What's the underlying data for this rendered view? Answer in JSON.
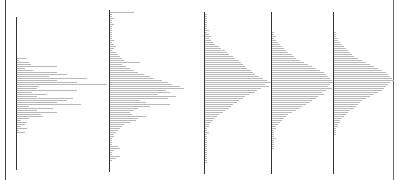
{
  "document": {
    "description": "Five side-by-side text histograms rendered as horizontal bar lines along vertical axes",
    "panels": [
      {
        "axis_left": 16,
        "axis_top": 17,
        "axis_height": 153,
        "bars_top": 58,
        "bars": [
          10,
          2,
          12,
          14,
          40,
          8,
          16,
          40,
          50,
          32,
          70,
          40,
          60,
          90,
          22,
          20,
          60,
          15,
          30,
          20,
          56,
          50,
          40,
          64,
          12,
          36,
          20,
          40,
          24,
          26,
          12,
          4,
          10,
          8,
          4,
          10,
          2,
          8
        ]
      },
      {
        "axis_left": 109,
        "axis_top": 10,
        "axis_height": 162,
        "bars_top": 12,
        "bars": [
          24,
          2,
          2,
          4,
          2,
          2,
          4,
          2,
          2,
          2,
          2,
          2,
          2,
          2,
          4,
          2,
          4,
          6,
          4,
          2,
          6,
          8,
          10,
          12,
          14,
          30,
          12,
          16,
          20,
          24,
          28,
          34,
          40,
          44,
          52,
          58,
          62,
          70,
          74,
          56,
          60,
          48,
          66,
          58,
          30,
          36,
          60,
          40,
          28,
          24,
          20,
          22,
          36,
          28,
          26,
          20,
          14,
          12,
          10,
          8,
          6,
          4,
          4,
          2,
          2,
          2,
          2,
          8,
          10,
          4,
          2,
          2,
          10,
          6,
          2
        ]
      },
      {
        "axis_left": 204,
        "axis_top": 12,
        "axis_height": 162,
        "bars_top": 14,
        "bars": [
          2,
          2,
          2,
          2,
          2,
          2,
          2,
          2,
          4,
          2,
          4,
          6,
          4,
          6,
          8,
          10,
          14,
          16,
          20,
          22,
          24,
          28,
          30,
          34,
          36,
          38,
          40,
          42,
          46,
          48,
          50,
          54,
          58,
          62,
          66,
          60,
          64,
          56,
          52,
          50,
          44,
          40,
          38,
          34,
          32,
          28,
          26,
          24,
          20,
          18,
          14,
          12,
          10,
          8,
          6,
          4,
          4,
          2,
          2,
          4,
          2,
          2,
          2,
          2,
          2,
          2,
          2,
          2,
          2,
          2,
          2,
          2,
          2,
          2,
          2
        ]
      },
      {
        "axis_left": 271,
        "axis_top": 12,
        "axis_height": 162,
        "bars_top": 32,
        "bars": [
          2,
          2,
          4,
          2,
          4,
          6,
          8,
          10,
          12,
          14,
          16,
          20,
          22,
          24,
          28,
          32,
          36,
          40,
          44,
          48,
          52,
          54,
          56,
          58,
          60,
          62,
          58,
          56,
          60,
          54,
          50,
          52,
          46,
          44,
          40,
          38,
          34,
          30,
          28,
          24,
          20,
          16,
          14,
          12,
          10,
          8,
          6,
          4,
          4,
          2,
          2,
          2,
          2,
          4,
          2,
          2,
          2,
          2,
          2
        ]
      },
      {
        "axis_left": 333,
        "axis_top": 12,
        "axis_height": 162,
        "bars_top": 32,
        "bars": [
          2,
          2,
          2,
          4,
          4,
          6,
          8,
          10,
          12,
          14,
          16,
          18,
          20,
          24,
          28,
          32,
          36,
          40,
          44,
          48,
          52,
          54,
          56,
          58,
          60,
          56,
          54,
          52,
          50,
          48,
          44,
          40,
          36,
          32,
          28,
          26,
          24,
          22,
          20,
          16,
          14,
          12,
          10,
          8,
          6,
          6,
          4,
          4,
          2,
          2,
          2,
          2
        ]
      }
    ]
  }
}
